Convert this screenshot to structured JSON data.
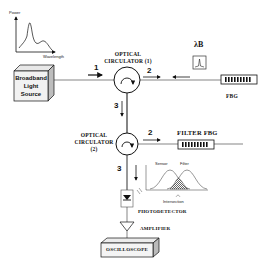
{
  "diagram": {
    "components": {
      "source": {
        "label_lines": [
          "Broadband",
          "Light",
          "Source"
        ]
      },
      "spectrum_inset": {
        "y_axis": "Power",
        "x_axis": "Wavelength"
      },
      "circulator1": {
        "label_lines": [
          "OPTICAL",
          "CIRCULATOR (1)"
        ]
      },
      "circulator2": {
        "label_lines": [
          "OPTICAL",
          "CIRCULATOR (2)"
        ]
      },
      "fbg": {
        "label": "FBG"
      },
      "bragg_symbol": {
        "label": "λB"
      },
      "filter_fbg": {
        "label": "FILTER FBG"
      },
      "photodetector": {
        "label": "PHOTODETECTOR"
      },
      "amplifier": {
        "label": "AMPLIFIER"
      },
      "oscilloscope": {
        "label": "OSCILLOSCOPE"
      },
      "overlap_plot": {
        "sensor_label": "Sensor",
        "filter_label": "Filter",
        "intersection_label": "Intersection"
      }
    },
    "port_numbers": {
      "c1_in": "1",
      "c1_out2": "2",
      "c1_out3": "3",
      "c2_out2": "2",
      "c2_out3": "3"
    }
  }
}
